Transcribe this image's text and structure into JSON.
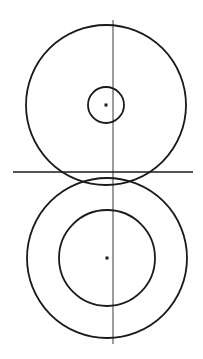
{
  "diagram": {
    "type": "geometric-construction",
    "background": "#ffffff",
    "stroke_color": "#1a1a1a",
    "axis_color": "#3a3a3a",
    "vertical_axis": {
      "x": 113,
      "y1": 20,
      "y2": 344
    },
    "horizontal_line": {
      "y": 172,
      "x1": 13,
      "x2": 193
    },
    "upper_group": {
      "center": {
        "x": 106,
        "y": 105
      },
      "outer_radius": 80,
      "inner_radius": 18
    },
    "lower_group": {
      "center": {
        "x": 107,
        "y": 258
      },
      "outer_radius": 80,
      "inner_radius": 48
    }
  }
}
